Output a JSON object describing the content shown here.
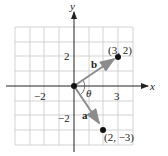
{
  "diagram": {
    "title": "",
    "axes": {
      "x_label": "x",
      "y_label": "y",
      "x_ticks": [
        {
          "value": -2,
          "label": "−2"
        },
        {
          "value": 3,
          "label": "3"
        }
      ],
      "y_ticks": [
        {
          "value": 2,
          "label": "2"
        },
        {
          "value": -2,
          "label": "−2"
        }
      ],
      "grid_range": {
        "x": [
          -4,
          4
        ],
        "y": [
          -4,
          4
        ]
      }
    },
    "vectors": [
      {
        "name": "b",
        "from": [
          0,
          0
        ],
        "to": [
          3,
          2
        ],
        "point_label": "(3, 2)"
      },
      {
        "name": "a",
        "from": [
          0,
          0
        ],
        "to": [
          2,
          -3
        ],
        "point_label": "(2, −3)"
      }
    ],
    "angle_label": "θ",
    "colors": {
      "grid": "#c8c8c8",
      "axis": "#222222",
      "vector": "#8c8c8c",
      "point": "#111111"
    }
  }
}
